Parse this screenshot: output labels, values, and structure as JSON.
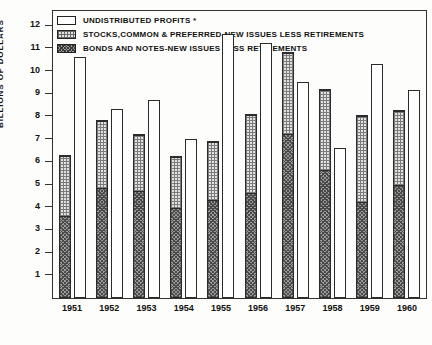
{
  "chart_data": {
    "type": "bar",
    "title": "",
    "subtitle": "",
    "xlabel": "",
    "ylabel": "BILLIONS OF DOLLARS",
    "ylim": [
      0,
      12.6
    ],
    "yticks": [
      1,
      2,
      3,
      4,
      5,
      6,
      7,
      8,
      9,
      10,
      11,
      12
    ],
    "grid": false,
    "legend_position": "top-left",
    "categories": [
      "1951",
      "1952",
      "1953",
      "1954",
      "1955",
      "1956",
      "1957",
      "1958",
      "1959",
      "1960"
    ],
    "series": [
      {
        "name": "BONDS AND NOTES-NEW ISSUES LESS RETIREMENTS",
        "bar": "left",
        "values": [
          3.6,
          4.85,
          4.7,
          3.95,
          4.3,
          4.6,
          7.2,
          5.65,
          4.2,
          4.95
        ]
      },
      {
        "name": "STOCKS,COMMON & PREFERRED-NEW ISSUES LESS RETIREMENTS",
        "bar": "left",
        "values": [
          2.7,
          2.95,
          2.5,
          2.3,
          2.6,
          3.5,
          3.6,
          3.55,
          3.85,
          3.3
        ]
      },
      {
        "name": "UNDISTRIBUTED PROFITS *",
        "bar": "right",
        "values": [
          10.6,
          8.3,
          8.7,
          7.0,
          11.6,
          11.2,
          9.5,
          6.6,
          10.3,
          9.15
        ]
      }
    ],
    "left_bar_totals": [
      6.3,
      7.8,
      7.2,
      6.25,
      6.9,
      8.1,
      10.8,
      9.2,
      8.05,
      8.25
    ]
  },
  "legend": {
    "items": [
      {
        "swatch": "profits",
        "label": "UNDISTRIBUTED  PROFITS  *"
      },
      {
        "swatch": "stocks",
        "label": "STOCKS,COMMON & PREFERRED-NEW ISSUES LESS RETIREMENTS"
      },
      {
        "swatch": "bonds",
        "label": "BONDS  AND NOTES-NEW ISSUES  LESS  RETIREMENTS"
      }
    ]
  }
}
